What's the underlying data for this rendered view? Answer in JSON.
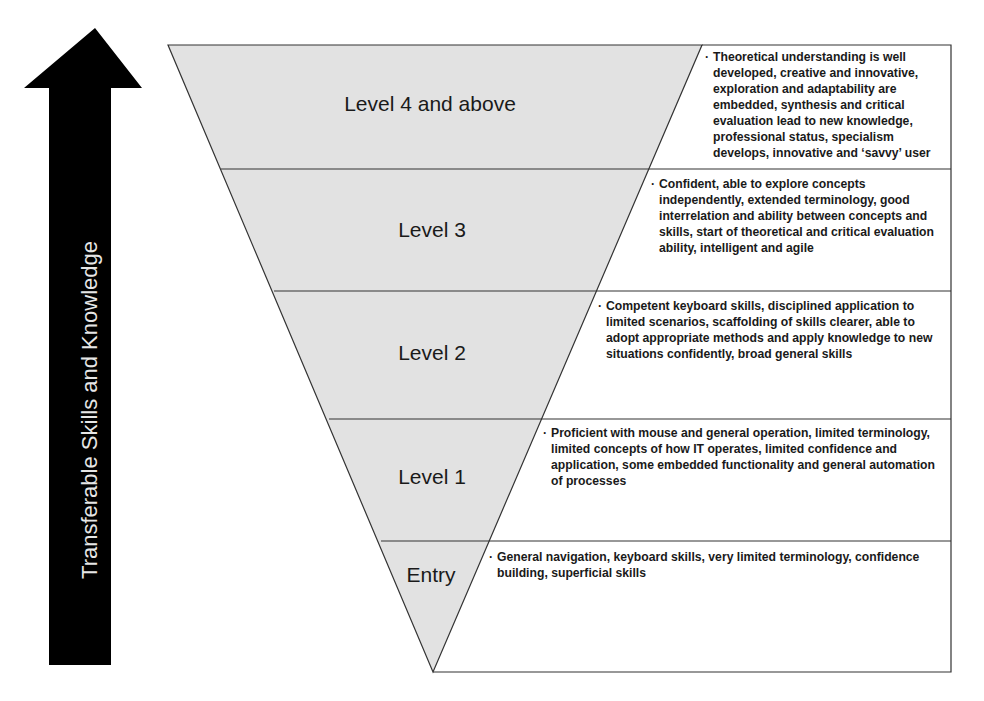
{
  "arrow": {
    "label": "Transferable Skills and Knowledge",
    "color": "#000000"
  },
  "colors": {
    "fill": "#e2e2e2",
    "stroke": "#333333"
  },
  "levels": [
    {
      "label": "Level 4 and above",
      "description": "Theoretical understanding is well developed, creative and innovative, exploration and adaptability are embedded, synthesis and critical evaluation lead to new knowledge, professional status, specialism develops, innovative and ‘savvy’ user"
    },
    {
      "label": "Level 3",
      "description": "Confident, able to explore concepts independently, extended terminology, good interrelation and ability between concepts and skills, start of theoretical and critical evaluation ability, intelligent and agile"
    },
    {
      "label": "Level 2",
      "description": "Competent keyboard skills, disciplined application to limited scenarios, scaffolding of skills clearer, able to adopt appropriate methods and apply knowledge to new situations confidently, broad general skills"
    },
    {
      "label": "Level 1",
      "description": "Proficient with mouse and general operation, limited terminology, limited concepts of how IT operates, limited confidence and application, some embedded functionality and general automation of processes"
    },
    {
      "label": "Entry",
      "description": "General navigation, keyboard skills, very limited terminology, confidence building, superficial skills"
    }
  ],
  "bullet": "·"
}
